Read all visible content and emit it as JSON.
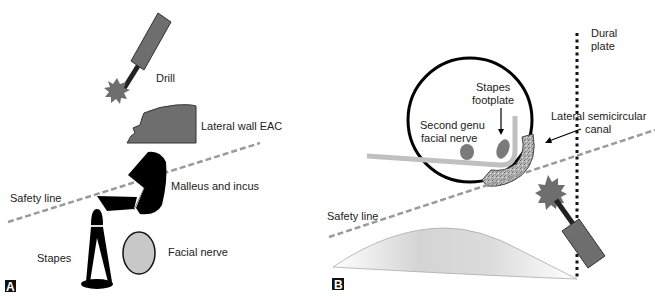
{
  "figure": {
    "panels": [
      {
        "id": "A",
        "tag": "A",
        "labels": {
          "drill": "Drill",
          "lateral_wall": "Lateral wall EAC",
          "malleus_incus": "Malleus and incus",
          "safety_line": "Safety line",
          "stapes": "Stapes",
          "facial_nerve": "Facial nerve"
        }
      },
      {
        "id": "B",
        "tag": "B",
        "labels": {
          "dural_plate_1": "Dural",
          "dural_plate_2": "plate",
          "stapes_footplate_1": "Stapes",
          "stapes_footplate_2": "footplate",
          "second_genu_1": "Second genu",
          "second_genu_2": "facial nerve",
          "lateral_scc_1": "Lateral semicircular",
          "lateral_scc_2": "canal",
          "safety_line": "Safety line"
        }
      }
    ],
    "colors": {
      "drill_gray": "#6e6e6e",
      "ossicle_black": "#000000",
      "nerve_gray": "#c8c8c8",
      "dashed_line": "#9a9a9a",
      "canal_gray": "#a8a8a8"
    }
  }
}
